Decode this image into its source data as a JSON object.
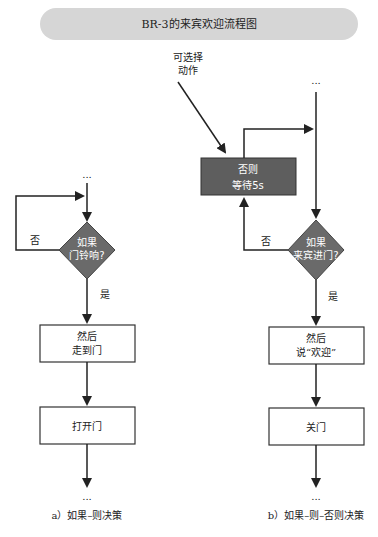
{
  "title": "BR-3的来宾欢迎流程图",
  "colors": {
    "banner": "#d6d6d6",
    "decision_fill": "#6a6a6a",
    "action_fill": "#5e5e5e",
    "line": "#222222",
    "box_border": "#333333",
    "light_text": "#ffffff"
  },
  "left_diagram": {
    "start_ellipsis": "...",
    "decision": {
      "line1": "如果",
      "line2": "门铃响?"
    },
    "no_label": "否",
    "yes_label": "是",
    "box1": {
      "line1": "然后",
      "line2": "走到门"
    },
    "box2": {
      "line1": "打开门"
    },
    "end_ellipsis": "...",
    "caption": "a）如果–则决策"
  },
  "right_diagram": {
    "optional_label": {
      "line1": "可选择",
      "line2": "动作"
    },
    "start_ellipsis": "...",
    "else_box": {
      "line1": "否则",
      "line2": "等待5s"
    },
    "decision": {
      "line1": "如果",
      "line2": "来宾进门?"
    },
    "no_label": "否",
    "yes_label": "是",
    "box1": {
      "line1": "然后",
      "line2": "说“欢迎”"
    },
    "box2": {
      "line1": "关门"
    },
    "end_ellipsis": "...",
    "caption": "b）如果–则–否则决策"
  }
}
